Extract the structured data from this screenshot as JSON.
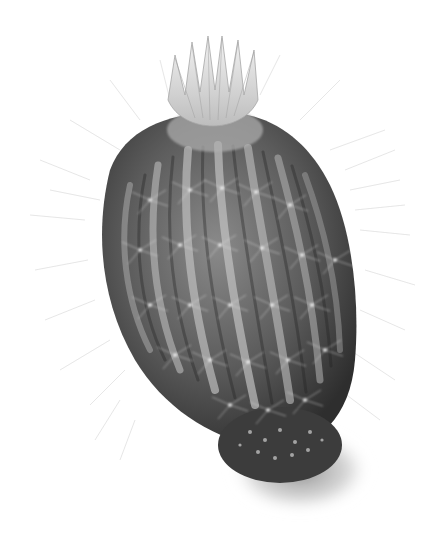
{
  "image": {
    "subject": "cactus illustration",
    "style": "grayscale botanical drawing",
    "elements": [
      "cactus-body",
      "flower-crown",
      "spines",
      "basal-offset",
      "ground-shadow"
    ]
  },
  "colors": {
    "background": "#ffffff",
    "body_dark": "#3a3a3a",
    "body_mid": "#6e6e6e",
    "rib_highlight": "#b8b8b8",
    "spine": "#d6d6d6",
    "flower": "#e4e4e4",
    "shadow": "#9a9a9a"
  }
}
